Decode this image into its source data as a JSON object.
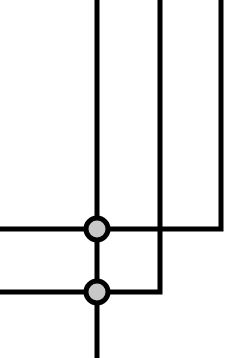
{
  "diagram": {
    "width": 246,
    "height": 358,
    "background": "#ffffff",
    "stroke_color": "#000000",
    "stroke_width": 5,
    "node_fill": "#c8c8c8",
    "node_radius": 11,
    "node_stroke_width": 5,
    "wires": [
      {
        "id": "trunk",
        "points": [
          [
            97,
            0
          ],
          [
            97,
            358
          ]
        ]
      },
      {
        "id": "wire-upper",
        "points": [
          [
            0,
            229
          ],
          [
            221,
            229
          ],
          [
            221,
            0
          ]
        ]
      },
      {
        "id": "wire-lower",
        "points": [
          [
            0,
            292
          ],
          [
            160,
            292
          ],
          [
            160,
            0
          ]
        ]
      }
    ],
    "junctions": [
      {
        "id": "junction-upper",
        "cx": 97,
        "cy": 229
      },
      {
        "id": "junction-lower",
        "cx": 97,
        "cy": 292
      }
    ]
  }
}
